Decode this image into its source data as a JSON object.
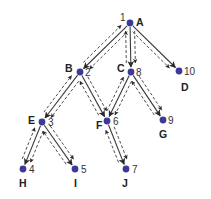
{
  "diagram": {
    "colors": {
      "node": "#3b3a96",
      "edge": "#3a3a3a"
    },
    "nodes": [
      {
        "id": "A",
        "letter": "A",
        "order": "1",
        "x": 130,
        "y": 23,
        "num_dx": -10,
        "num_dy": -2,
        "letter_dx": 6,
        "letter_dy": 3
      },
      {
        "id": "B",
        "letter": "B",
        "order": "2",
        "x": 80,
        "y": 72,
        "num_dx": 5,
        "num_dy": 4,
        "letter_dx": -15,
        "letter_dy": 0
      },
      {
        "id": "C",
        "letter": "C",
        "order": "8",
        "x": 131,
        "y": 72,
        "num_dx": 5,
        "num_dy": 4,
        "letter_dx": -14,
        "letter_dy": 0
      },
      {
        "id": "D",
        "letter": "D",
        "order": "10",
        "x": 179,
        "y": 71,
        "num_dx": 5,
        "num_dy": 4,
        "letter_dx": 2,
        "letter_dy": 20
      },
      {
        "id": "E",
        "letter": "E",
        "order": "3",
        "x": 42,
        "y": 122,
        "num_dx": 6,
        "num_dy": 4,
        "letter_dx": -14,
        "letter_dy": 2
      },
      {
        "id": "F",
        "letter": "F",
        "order": "6",
        "x": 107,
        "y": 121,
        "num_dx": 6,
        "num_dy": 4,
        "letter_dx": -11,
        "letter_dy": 8
      },
      {
        "id": "G",
        "letter": "G",
        "order": "9",
        "x": 163,
        "y": 120,
        "num_dx": 5,
        "num_dy": 4,
        "letter_dx": -4,
        "letter_dy": 18
      },
      {
        "id": "H",
        "letter": "H",
        "order": "4",
        "x": 23,
        "y": 169,
        "num_dx": 6,
        "num_dy": 4,
        "letter_dx": -4,
        "letter_dy": 18
      },
      {
        "id": "I",
        "letter": "I",
        "order": "5",
        "x": 75,
        "y": 169,
        "num_dx": 6,
        "num_dy": 4,
        "letter_dx": -1,
        "letter_dy": 18
      },
      {
        "id": "J",
        "letter": "J",
        "order": "7",
        "x": 126,
        "y": 169,
        "num_dx": 6,
        "num_dy": 4,
        "letter_dx": -4,
        "letter_dy": 18
      }
    ],
    "edges": [
      {
        "from": "A",
        "to": "B",
        "return": true
      },
      {
        "from": "A",
        "to": "C",
        "return": true
      },
      {
        "from": "A",
        "to": "D",
        "return": false
      },
      {
        "from": "B",
        "to": "E",
        "return": true
      },
      {
        "from": "B",
        "to": "F",
        "return": true
      },
      {
        "from": "C",
        "to": "F",
        "return": true
      },
      {
        "from": "C",
        "to": "G",
        "return": true
      },
      {
        "from": "E",
        "to": "H",
        "return": true
      },
      {
        "from": "E",
        "to": "I",
        "return": true
      },
      {
        "from": "F",
        "to": "J",
        "return": true
      }
    ],
    "legend": {
      "solid": "graph edge (parent to child)",
      "dashed_down": "traversal descends",
      "dashed_up": "traversal backtracks"
    }
  }
}
